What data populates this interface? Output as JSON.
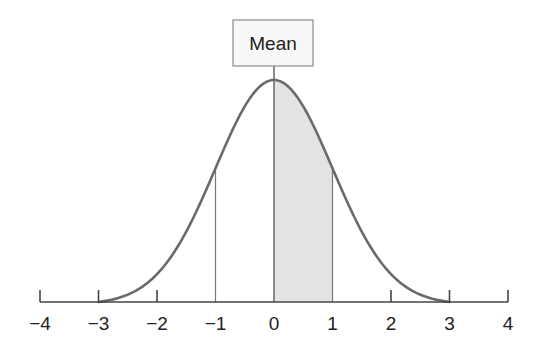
{
  "chart_data": {
    "type": "line",
    "title": "",
    "xlabel": "",
    "ylabel": "",
    "xlim": [
      -4,
      4
    ],
    "x_ticks": [
      -4,
      -3,
      -2,
      -1,
      0,
      1,
      2,
      3,
      4
    ],
    "x_tick_labels": [
      "−4",
      "−3",
      "−2",
      "−1",
      "0",
      "1",
      "2",
      "3",
      "4"
    ],
    "curve": {
      "distribution": "normal",
      "mean": 0,
      "sd": 1,
      "x_range": [
        -3,
        3
      ]
    },
    "shaded_region": {
      "from": 0,
      "to": 1,
      "color": "#e3e3e3"
    },
    "vertical_lines": [
      -1,
      0,
      1
    ],
    "annotations": [
      {
        "text": "Mean",
        "x": 0,
        "position": "above peak"
      }
    ],
    "grid": false,
    "legend": null
  },
  "annotation": {
    "mean_label": "Mean"
  },
  "axis": {
    "labels": [
      "−4",
      "−3",
      "−2",
      "−1",
      "0",
      "1",
      "2",
      "3",
      "4"
    ]
  },
  "colors": {
    "curve": "#666666",
    "axis": "#444444",
    "shade": "#e3e3e3",
    "box_border": "#888888",
    "box_fill": "#f7f7f7"
  }
}
